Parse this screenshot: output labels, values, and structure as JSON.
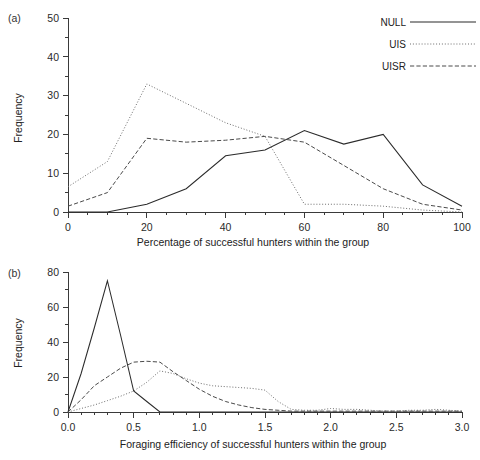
{
  "figure": {
    "panel_a_label": "(a)",
    "panel_b_label": "(b)"
  },
  "legend": {
    "position": "top-right",
    "items": [
      {
        "label": "NULL",
        "style": "solid",
        "color": "#2b2b2b"
      },
      {
        "label": "UIS",
        "style": "dotted",
        "color": "#6d6d6d"
      },
      {
        "label": "UISR",
        "style": "dashed",
        "color": "#4a4a4a"
      }
    ]
  },
  "axis_titles": {
    "panel_a_x": "Percentage  of  successful  hunters  within  the  group",
    "panel_a_y": "Frequency",
    "panel_b_x": "Foraging  efficiency  of  successful  hunters  within  the  group",
    "panel_b_y": "Frequency"
  },
  "ticks": {
    "panel_a_x": [
      "0",
      "20",
      "40",
      "60",
      "80",
      "100"
    ],
    "panel_a_y": [
      "0",
      "10",
      "20",
      "30",
      "40",
      "50"
    ],
    "panel_b_x": [
      "0",
      "0.5",
      "1.0",
      "1.5",
      "2.0",
      "2.5",
      "3.0"
    ],
    "panel_b_y": [
      "0",
      "20",
      "40",
      "60",
      "80"
    ]
  },
  "chart_data": [
    {
      "type": "line",
      "panel": "(a)",
      "title": "",
      "xlabel": "Percentage of successful hunters within the group",
      "ylabel": "Frequency",
      "xlim": [
        0,
        100
      ],
      "ylim": [
        0,
        50
      ],
      "xtick_step": 20,
      "xminor_step": 5,
      "ytick_step": 10,
      "yminor_step": 5,
      "grid": false,
      "legend_position": "top-right",
      "x": [
        0,
        10,
        20,
        30,
        40,
        50,
        60,
        70,
        80,
        90,
        100
      ],
      "series": [
        {
          "name": "NULL",
          "style": "solid",
          "values": [
            0,
            0,
            2,
            6,
            14.5,
            16,
            21,
            17.5,
            20,
            7,
            1.5
          ]
        },
        {
          "name": "UIS",
          "style": "dotted",
          "values": [
            6.5,
            13,
            33,
            28,
            23,
            19.5,
            2,
            2,
            1.5,
            0.5,
            0
          ]
        },
        {
          "name": "UISR",
          "style": "dashed",
          "values": [
            1.5,
            5,
            19,
            18,
            18.5,
            19.5,
            18,
            12,
            6,
            2,
            0.5
          ]
        }
      ]
    },
    {
      "type": "line",
      "panel": "(b)",
      "title": "",
      "xlabel": "Foraging efficiency of successful hunters within the group",
      "ylabel": "Frequency",
      "xlim": [
        0,
        3.0
      ],
      "ylim": [
        0,
        80
      ],
      "xtick_step": 0.5,
      "xminor_step": 0.1,
      "ytick_step": 20,
      "yminor_step": 10,
      "grid": false,
      "legend_position": "none",
      "x": [
        0,
        0.1,
        0.2,
        0.3,
        0.4,
        0.5,
        0.6,
        0.7,
        0.8,
        0.9,
        1.0,
        1.1,
        1.2,
        1.3,
        1.4,
        1.5,
        1.6,
        1.7,
        1.8,
        1.9,
        2.0,
        2.1,
        2.2,
        2.3,
        2.4,
        2.5,
        2.6,
        2.7,
        2.8,
        2.9,
        3.0
      ],
      "series": [
        {
          "name": "NULL",
          "style": "solid",
          "values": [
            0,
            22,
            48,
            75,
            44,
            12,
            6,
            0,
            0,
            0,
            0,
            0,
            0,
            0,
            0,
            0,
            0,
            0,
            0,
            0,
            0,
            0,
            0,
            0,
            0,
            0,
            0,
            0,
            0,
            0,
            0
          ]
        },
        {
          "name": "UIS",
          "style": "dotted",
          "values": [
            0,
            2,
            4,
            6.5,
            9,
            12,
            17,
            23.5,
            22,
            19,
            16.5,
            15,
            14.5,
            14,
            13.5,
            12.5,
            6,
            1.5,
            1,
            1,
            2,
            1.5,
            1.5,
            1,
            0.5,
            0.5,
            1,
            1,
            1.5,
            1,
            0.5
          ]
        },
        {
          "name": "UISR",
          "style": "dashed",
          "values": [
            0,
            7,
            15,
            20,
            25,
            28.5,
            29,
            28.5,
            23,
            18,
            13,
            9,
            6,
            4,
            2.5,
            1.5,
            1,
            0.5,
            0.5,
            0.5,
            0.5,
            0.5,
            0.5,
            0.5,
            0.5,
            0.5,
            0.5,
            0.5,
            0.5,
            0.5,
            0.5
          ]
        }
      ]
    }
  ]
}
